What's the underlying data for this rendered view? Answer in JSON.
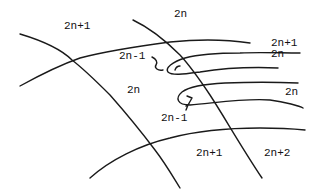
{
  "diagram": {
    "labels": [
      {
        "id": "top-left",
        "text": "2n+1",
        "x": 64,
        "y": 27
      },
      {
        "id": "top-center",
        "text": "2n",
        "x": 174,
        "y": 14
      },
      {
        "id": "upper-right-1",
        "text": "2n+1",
        "x": 271,
        "y": 42
      },
      {
        "id": "upper-right-2",
        "text": "2n",
        "x": 271,
        "y": 53
      },
      {
        "id": "loop-upper-label",
        "text": "2n-1",
        "x": 119,
        "y": 56
      },
      {
        "id": "middle-left",
        "text": "2n",
        "x": 127,
        "y": 88
      },
      {
        "id": "right-middle",
        "text": "2n",
        "x": 285,
        "y": 91
      },
      {
        "id": "loop-lower-label",
        "text": "2n-1",
        "x": 161,
        "y": 113
      },
      {
        "id": "bottom-middle",
        "text": "2n+1",
        "x": 196,
        "y": 152
      },
      {
        "id": "bottom-right",
        "text": "2n+2",
        "x": 264,
        "y": 152
      }
    ],
    "stroke_color": "#1a1a1a",
    "background": "#ffffff"
  }
}
